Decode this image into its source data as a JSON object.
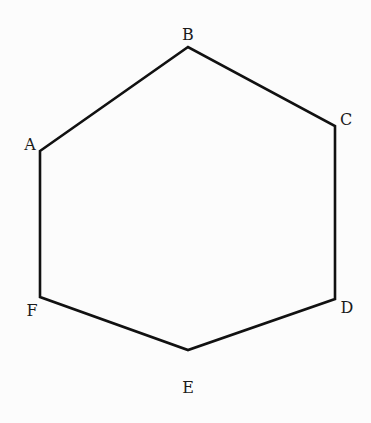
{
  "diagram": {
    "type": "regular-hexagon",
    "stroke_color": "#111111",
    "background_color": "#fcfcfc",
    "vertices": [
      {
        "label": "A",
        "x": 40,
        "y": 151,
        "label_x": 30,
        "label_y": 150
      },
      {
        "label": "B",
        "x": 188,
        "y": 47,
        "label_x": 188,
        "label_y": 40
      },
      {
        "label": "C",
        "x": 335,
        "y": 126,
        "label_x": 346,
        "label_y": 125
      },
      {
        "label": "D",
        "x": 335,
        "y": 299,
        "label_x": 347,
        "label_y": 313
      },
      {
        "label": "E",
        "x": 188,
        "y": 350,
        "label_x": 188,
        "label_y": 393
      },
      {
        "label": "F",
        "x": 40,
        "y": 297,
        "label_x": 32,
        "label_y": 316
      }
    ]
  }
}
